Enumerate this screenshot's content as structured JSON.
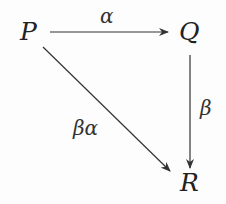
{
  "diagram": {
    "type": "commutative-triangle",
    "nodes": {
      "p": "P",
      "q": "Q",
      "r": "R"
    },
    "arrows": [
      {
        "from": "P",
        "to": "Q",
        "label": "α"
      },
      {
        "from": "Q",
        "to": "R",
        "label": "β"
      },
      {
        "from": "P",
        "to": "R",
        "label": "βα"
      }
    ],
    "labels": {
      "alpha": "α",
      "beta": "β",
      "beta_alpha": "βα"
    },
    "colors": {
      "stroke": "#333333",
      "text": "#222222"
    }
  }
}
